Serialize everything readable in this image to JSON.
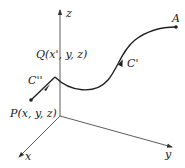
{
  "diagram": {
    "axes": {
      "x_label": "x",
      "y_label": "y",
      "z_label": "z"
    },
    "points": {
      "A": {
        "label": "A"
      },
      "Q": {
        "label": "Q(x', y, z)"
      },
      "P": {
        "label": "P(x, y, z)"
      }
    },
    "curves": {
      "C_prime": {
        "label": "C'"
      },
      "C_double_prime": {
        "label": "C''"
      }
    },
    "colors": {
      "stroke": "#222222",
      "background": "#ffffff"
    }
  }
}
